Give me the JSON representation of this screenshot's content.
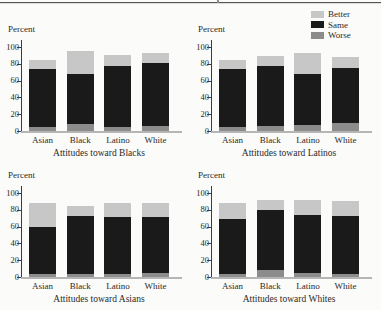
{
  "figure": {
    "ylabel": "Percent",
    "top_rule_color": "#555555",
    "background": "#fbfbf9"
  },
  "legend": {
    "position": "top-right",
    "items": [
      {
        "label": "Better",
        "color": "#c7c7c7"
      },
      {
        "label": "Same",
        "color": "#1a1a1a"
      },
      {
        "label": "Worse",
        "color": "#8c8c8c"
      }
    ]
  },
  "chart_data": [
    {
      "type": "bar",
      "stacked": true,
      "title": "Attitudes toward Blacks",
      "ylabel": "Percent",
      "ylim": [
        0,
        100
      ],
      "yticks": [
        0,
        20,
        40,
        60,
        80,
        100
      ],
      "grid": false,
      "categories": [
        "Asian",
        "Black",
        "Latino",
        "White"
      ],
      "series": [
        {
          "name": "Worse",
          "values": [
            5,
            8,
            5,
            6
          ]
        },
        {
          "name": "Same",
          "values": [
            69,
            60,
            73,
            75
          ]
        },
        {
          "name": "Better",
          "values": [
            11,
            27,
            12,
            12
          ]
        }
      ]
    },
    {
      "type": "bar",
      "stacked": true,
      "title": "Attitudes toward Latinos",
      "ylabel": "Percent",
      "ylim": [
        0,
        100
      ],
      "yticks": [
        0,
        20,
        40,
        60,
        80,
        100
      ],
      "grid": false,
      "categories": [
        "Asian",
        "Black",
        "Latino",
        "White"
      ],
      "series": [
        {
          "name": "Worse",
          "values": [
            5,
            6,
            7,
            10
          ]
        },
        {
          "name": "Same",
          "values": [
            69,
            71,
            61,
            65
          ]
        },
        {
          "name": "Better",
          "values": [
            11,
            12,
            25,
            13
          ]
        }
      ]
    },
    {
      "type": "bar",
      "stacked": true,
      "title": "Attitudes toward Asians",
      "ylabel": "Percent",
      "ylim": [
        0,
        100
      ],
      "yticks": [
        0,
        20,
        40,
        60,
        80,
        100
      ],
      "grid": false,
      "categories": [
        "Asian",
        "Black",
        "Latino",
        "White"
      ],
      "series": [
        {
          "name": "Worse",
          "values": [
            3,
            4,
            4,
            5
          ]
        },
        {
          "name": "Same",
          "values": [
            57,
            69,
            67,
            67
          ]
        },
        {
          "name": "Better",
          "values": [
            28,
            12,
            17,
            16
          ]
        }
      ]
    },
    {
      "type": "bar",
      "stacked": true,
      "title": "Attitudes toward Whites",
      "ylabel": "Percent",
      "ylim": [
        0,
        100
      ],
      "yticks": [
        0,
        20,
        40,
        60,
        80,
        100
      ],
      "grid": false,
      "categories": [
        "Asian",
        "Black",
        "Latino",
        "White"
      ],
      "series": [
        {
          "name": "Worse",
          "values": [
            4,
            8,
            5,
            4
          ]
        },
        {
          "name": "Same",
          "values": [
            65,
            72,
            69,
            69
          ]
        },
        {
          "name": "Better",
          "values": [
            19,
            12,
            18,
            17
          ]
        }
      ]
    }
  ]
}
